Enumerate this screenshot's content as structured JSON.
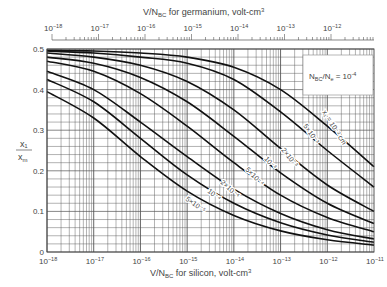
{
  "chart_data": {
    "type": "line",
    "title": "",
    "xlabel": "V/N_BC for silicon, volt-cm^3",
    "x2label": "V/N_BC for germanium, volt-cm^3",
    "ylabel": "x1 / xm",
    "xscale": "log",
    "xlim": [
      1e-18,
      1e-11
    ],
    "x2lim": [
      1e-18,
      1e-12
    ],
    "ylim": [
      0,
      0.5
    ],
    "grid": true,
    "x_ticks": [
      "10^-18",
      "10^-17",
      "10^-16",
      "10^-15",
      "10^-14",
      "10^-13",
      "10^-12",
      "10^-11"
    ],
    "x2_ticks": [
      "10^-18",
      "10^-17",
      "10^-16",
      "10^-15",
      "10^-14",
      "10^-13",
      "10^-12"
    ],
    "y_ticks": [
      "0",
      "0.1",
      "0.2",
      "0.3",
      "0.4",
      "0.5"
    ],
    "annotation_box": "N_BC / N_e = 10^-4",
    "x_log_exponents": [
      -18,
      -17,
      -16,
      -15,
      -14,
      -13,
      -12,
      -11
    ],
    "series": [
      {
        "name": "x1 = 10^-2 cm",
        "values": [
          0.497,
          0.495,
          0.49,
          0.48,
          0.455,
          0.4,
          0.31,
          0.21
        ]
      },
      {
        "name": "5x10^-3",
        "values": [
          0.495,
          0.49,
          0.48,
          0.465,
          0.425,
          0.345,
          0.25,
          0.16
        ]
      },
      {
        "name": "2x10^-3",
        "values": [
          0.49,
          0.48,
          0.46,
          0.42,
          0.35,
          0.255,
          0.165,
          0.1
        ]
      },
      {
        "name": "10^-3",
        "values": [
          0.48,
          0.465,
          0.43,
          0.37,
          0.285,
          0.195,
          0.12,
          0.07
        ]
      },
      {
        "name": "5x10^-4",
        "values": [
          0.47,
          0.445,
          0.39,
          0.31,
          0.22,
          0.14,
          0.085,
          0.05
        ]
      },
      {
        "name": "2x10^-4",
        "values": [
          0.445,
          0.4,
          0.32,
          0.235,
          0.155,
          0.095,
          0.055,
          0.032
        ]
      },
      {
        "name": "10^-4",
        "values": [
          0.425,
          0.37,
          0.28,
          0.19,
          0.12,
          0.072,
          0.042,
          0.024
        ]
      },
      {
        "name": "5x10^-5",
        "values": [
          0.395,
          0.33,
          0.235,
          0.15,
          0.09,
          0.052,
          0.03,
          0.017
        ]
      }
    ],
    "curve_labels": [
      {
        "text": "x₁ = 10⁻² cm",
        "x": 322,
        "y": 112,
        "rot": 58
      },
      {
        "text": "5×10⁻³",
        "x": 303,
        "y": 126,
        "rot": 55
      },
      {
        "text": "2×10⁻³",
        "x": 281,
        "y": 150,
        "rot": 52
      },
      {
        "text": "10⁻³",
        "x": 264,
        "y": 159,
        "rot": 48
      },
      {
        "text": "5×10⁻⁴",
        "x": 245,
        "y": 170,
        "rot": 45
      },
      {
        "text": "2×10⁻⁴",
        "x": 220,
        "y": 183,
        "rot": 42
      },
      {
        "text": "10⁻⁴",
        "x": 207,
        "y": 192,
        "rot": 38
      },
      {
        "text": "5×10⁻⁵",
        "x": 185,
        "y": 200,
        "rot": 35
      }
    ]
  },
  "labels": {
    "top_axis_title": "V/N",
    "top_axis_sub": "BC",
    "top_axis_rest": " for germanium, volt-cm",
    "bottom_axis_title": "V/N",
    "bottom_axis_sub": "BC",
    "bottom_axis_rest": " for silicon, volt-cm",
    "cube": "3",
    "y_num": "x₁",
    "y_den": "x",
    "y_den_sub": "m",
    "box_text": "N",
    "box_sub1": "BC",
    "box_mid": "/N",
    "box_sub2": "e",
    "box_rest": " = 10",
    "box_exp": "-4"
  }
}
